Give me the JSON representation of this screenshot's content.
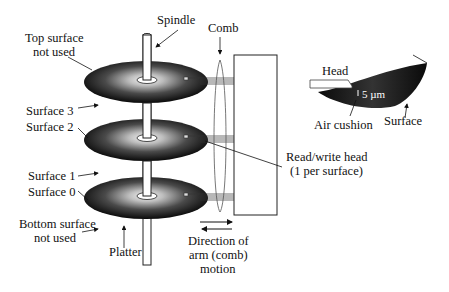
{
  "diagram": {
    "labels": {
      "spindle": "Spindle",
      "comb": "Comb",
      "top_surface_line1": "Top surface",
      "top_surface_line2": "not used",
      "surface3": "Surface 3",
      "surface2": "Surface 2",
      "surface1": "Surface 1",
      "surface0": "Surface 0",
      "bottom_surface_line1": "Bottom surface",
      "bottom_surface_line2": "not used",
      "platter": "Platter",
      "rw_head_line1": "Read/write head",
      "rw_head_line2": "(1 per surface)",
      "direction_line1": "Direction of",
      "direction_line2": "arm (comb)",
      "direction_line3": "motion"
    },
    "detail": {
      "head": "Head",
      "gap": "5 µm",
      "air_cushion": "Air cushion",
      "surface": "Surface"
    },
    "platter_count": 3
  }
}
